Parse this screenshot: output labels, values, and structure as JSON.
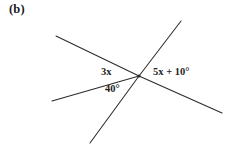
{
  "figure": {
    "part_label": "(b)",
    "background_color": "#ffffff",
    "stroke_color": "#2b2b2b",
    "text_color": "#1f1f1f",
    "width": 237,
    "height": 146
  },
  "diagram": {
    "type": "intersecting-lines-angle-diagram",
    "vertex": {
      "x": 139,
      "y": 76
    },
    "rays": [
      {
        "name": "upper-left-ray",
        "x1": 56,
        "y1": 36,
        "x2": 139,
        "y2": 76
      },
      {
        "name": "lower-left-ray",
        "x1": 52,
        "y1": 101,
        "x2": 139,
        "y2": 76
      },
      {
        "name": "upper-right-ray",
        "x1": 139,
        "y1": 76,
        "x2": 181,
        "y2": 21
      },
      {
        "name": "lower-left-steep-ray",
        "x1": 139,
        "y1": 76,
        "x2": 90,
        "y2": 143
      },
      {
        "name": "lower-right-ray",
        "x1": 139,
        "y1": 76,
        "x2": 222,
        "y2": 113
      }
    ],
    "labels": [
      {
        "name": "angle-3x",
        "text": "3x"
      },
      {
        "name": "angle-40",
        "text": "40°"
      },
      {
        "name": "angle-5x-plus-10",
        "text": "5x + 10°"
      }
    ]
  },
  "labels": {
    "three_x": "3x",
    "forty_degrees": "40°",
    "five_x_plus_ten": "5x + 10°"
  }
}
